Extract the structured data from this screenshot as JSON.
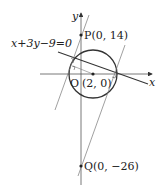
{
  "diagram": {
    "axes": {
      "x_label": "x",
      "y_label": "y",
      "origin_label": "O"
    },
    "points": {
      "P": {
        "label": "P(0, 14)"
      },
      "Q": {
        "label": "Q(0, −26)"
      },
      "C": {
        "label": "(2, 0)"
      }
    },
    "line_label": "x+3y−9=0",
    "colors": {
      "stroke": "#333333",
      "thin": "#666666"
    }
  }
}
